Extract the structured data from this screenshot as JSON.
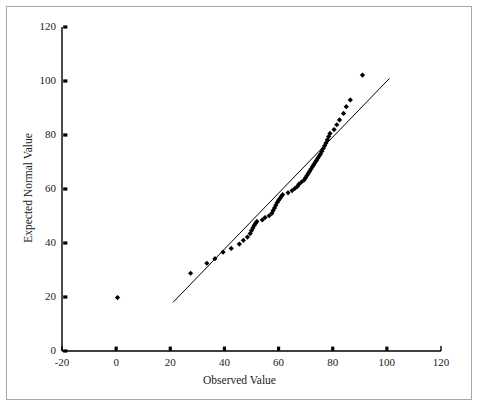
{
  "chart_data": {
    "type": "scatter",
    "title": "",
    "xlabel": "Observed Value",
    "ylabel": "Expected Normal Value",
    "xlim": [
      -20,
      120
    ],
    "ylim": [
      0,
      120
    ],
    "xticks": [
      -20,
      0,
      20,
      40,
      60,
      80,
      100,
      120
    ],
    "yticks": [
      0,
      20,
      40,
      60,
      80,
      100,
      120
    ],
    "xtick_labels": [
      "-20",
      "0",
      "20",
      "40",
      "60",
      "80",
      "100",
      "120"
    ],
    "ytick_labels": [
      "0",
      "20",
      "40",
      "60",
      "80",
      "100",
      "120"
    ],
    "grid": false,
    "legend": false,
    "marker": "diamond",
    "marker_color": "#000000",
    "line_color": "#000000",
    "axis_color": "#000000",
    "background_color": "#ffffff",
    "frame_color": "#a8a8a8",
    "series": [
      {
        "name": "Q-Q points",
        "type": "scatter",
        "points": [
          [
            0.5,
            19.8
          ],
          [
            27.5,
            28.8
          ],
          [
            33.5,
            32.5
          ],
          [
            36.5,
            34.2
          ],
          [
            39.5,
            36.6
          ],
          [
            42.5,
            38.0
          ],
          [
            45.5,
            39.6
          ],
          [
            47.0,
            41.0
          ],
          [
            48.5,
            42.2
          ],
          [
            49.5,
            43.5
          ],
          [
            50.0,
            44.6
          ],
          [
            50.5,
            45.6
          ],
          [
            51.0,
            46.5
          ],
          [
            51.5,
            47.3
          ],
          [
            52.0,
            48.0
          ],
          [
            54.0,
            48.6
          ],
          [
            55.0,
            49.4
          ],
          [
            56.5,
            50.1
          ],
          [
            57.5,
            51.0
          ],
          [
            58.0,
            52.0
          ],
          [
            58.5,
            53.0
          ],
          [
            59.0,
            54.0
          ],
          [
            59.5,
            55.0
          ],
          [
            60.0,
            55.8
          ],
          [
            60.5,
            56.5
          ],
          [
            61.0,
            57.2
          ],
          [
            61.5,
            57.9
          ],
          [
            63.5,
            58.6
          ],
          [
            65.0,
            59.4
          ],
          [
            66.0,
            60.2
          ],
          [
            67.0,
            61.0
          ],
          [
            67.5,
            61.8
          ],
          [
            68.5,
            62.6
          ],
          [
            69.5,
            63.4
          ],
          [
            70.0,
            64.2
          ],
          [
            70.5,
            65.0
          ],
          [
            71.0,
            65.8
          ],
          [
            71.5,
            66.6
          ],
          [
            72.0,
            67.4
          ],
          [
            72.5,
            68.2
          ],
          [
            73.0,
            69.0
          ],
          [
            73.5,
            69.8
          ],
          [
            74.0,
            70.6
          ],
          [
            74.5,
            71.4
          ],
          [
            75.0,
            72.2
          ],
          [
            75.5,
            73.0
          ],
          [
            76.0,
            74.0
          ],
          [
            76.5,
            75.0
          ],
          [
            77.0,
            76.0
          ],
          [
            77.5,
            77.0
          ],
          [
            78.0,
            78.2
          ],
          [
            78.5,
            79.4
          ],
          [
            79.0,
            80.6
          ],
          [
            80.5,
            82.0
          ],
          [
            81.5,
            83.8
          ],
          [
            82.5,
            85.6
          ],
          [
            84.0,
            88.0
          ],
          [
            85.0,
            90.5
          ],
          [
            86.5,
            93.0
          ],
          [
            91.0,
            102.2
          ]
        ]
      }
    ],
    "reference_line": {
      "name": "normal reference line",
      "type": "line",
      "x_start": 21.0,
      "y_start": 18.0,
      "x_end": 101.0,
      "y_end": 101.0
    }
  }
}
